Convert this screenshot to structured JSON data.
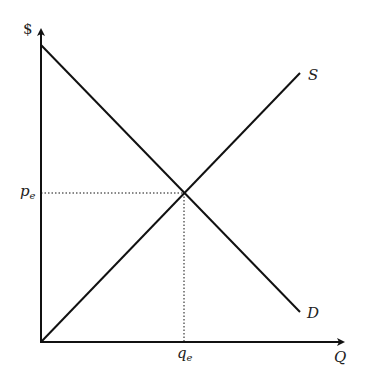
{
  "diagram": {
    "type": "supply-demand",
    "axes": {
      "y_label": "$",
      "x_label": "Q"
    },
    "curves": {
      "supply_label": "S",
      "demand_label": "D"
    },
    "equilibrium": {
      "price_label": "p",
      "price_sub": "e",
      "quantity_label": "q",
      "quantity_sub": "e"
    }
  }
}
